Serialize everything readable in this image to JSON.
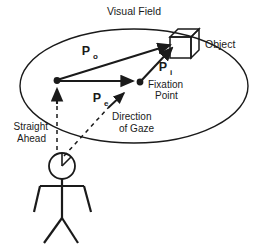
{
  "figure": {
    "title": "Visual Field",
    "labels": {
      "visual_field": "Visual Field",
      "object": "Object",
      "fixation_point_line1": "Fixation",
      "fixation_point_line2": "Point",
      "straight_ahead_line1": "Straight",
      "straight_ahead_line2": "Ahead",
      "direction_of_gaze_line1": "Direction",
      "direction_of_gaze_line2": "of Gaze"
    },
    "vectors": [
      {
        "name": "P_o",
        "base": "P",
        "subscript": "o",
        "meaning": "vector from eye to object"
      },
      {
        "name": "P_e",
        "base": "P",
        "subscript": "e",
        "meaning": "vector from eye to fixation point"
      },
      {
        "name": "P_i",
        "base": "P",
        "subscript": "i",
        "meaning": "vector from fixation point to object"
      }
    ],
    "colors": {
      "stroke": "#1a1a1a",
      "text": "#1a1a1a",
      "background": "#ffffff",
      "object_fill": "#ffffff"
    },
    "elements": {
      "visual_field_shape": "ellipse",
      "observer": "stick-figure",
      "object_shape": "3d-cube",
      "gaze_line_style": "dashed",
      "straight_ahead_line_style": "dashed"
    }
  }
}
